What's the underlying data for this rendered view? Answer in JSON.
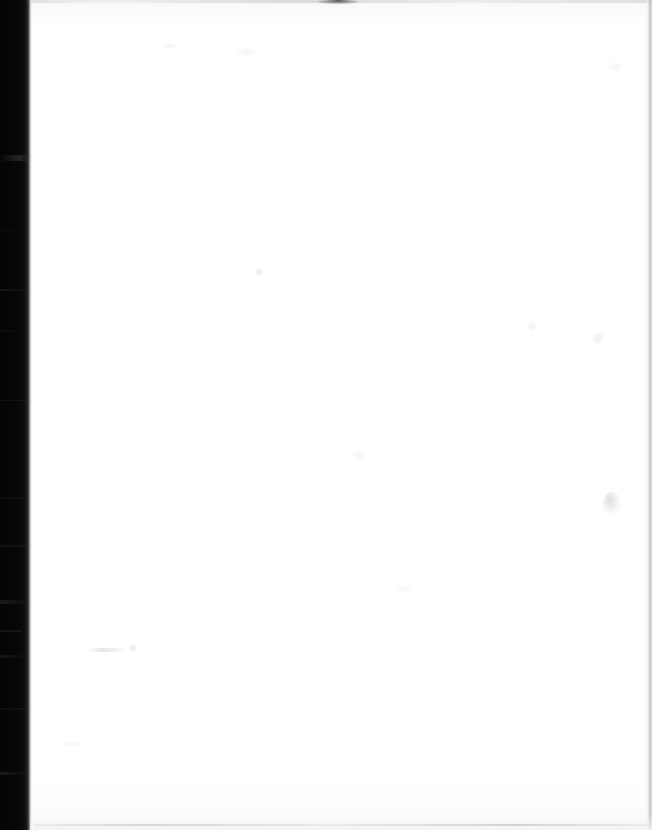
{
  "document": {
    "kind": "scanned-blank-page",
    "page_width_px": 652,
    "page_height_px": 830,
    "visible_text": "",
    "text_content_present": false,
    "description": "Scan of a blank sheet of paper; no typed or handwritten text is legible anywhere on the page."
  },
  "colors": {
    "page_white": "#ffffff",
    "paper_tint": "#fbfbfc",
    "gutter_black": "#050505",
    "edge_gray": "#c6c8cd",
    "speck_gray": "#d6d8dc"
  },
  "regions": {
    "gutter": {
      "name": "left-gutter-shadow",
      "x": 0,
      "y": 0,
      "width": 33,
      "height": 830,
      "note": "Near-black vertical band along the full left edge of the scan"
    },
    "page": {
      "name": "paper-surface",
      "x": 33,
      "y": 0,
      "width": 619,
      "height": 830,
      "note": "Blank white paper surface filling the remainder of the frame"
    }
  },
  "edges": {
    "top_line": "faint gray scan edge line across the top",
    "top_smudge": "small dark smudge near the top edge around x=320-356",
    "right_line": "faint gray vertical edge line at the far right",
    "bottom_line": "faint gray edge line near the bottom"
  },
  "artifacts": [
    {
      "name": "speck-right-mid",
      "x": 603,
      "y": 492
    },
    {
      "name": "speck-center-upper",
      "x": 255,
      "y": 269
    },
    {
      "name": "smudge-left-lower",
      "x": 88,
      "y": 648
    },
    {
      "name": "speck-right-upper",
      "x": 527,
      "y": 322
    },
    {
      "name": "speck-far-right",
      "x": 592,
      "y": 332
    }
  ]
}
